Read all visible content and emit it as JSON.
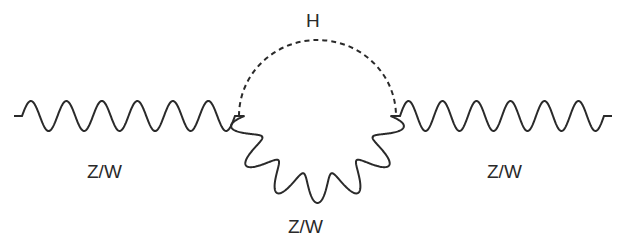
{
  "diagram": {
    "type": "feynman-diagram",
    "stroke_color": "#2a2a2a",
    "background": "#ffffff",
    "labels": {
      "higgs": "H",
      "left_boson": "Z/W",
      "loop_boson": "Z/W",
      "right_boson": "Z/W"
    },
    "vertices": [
      {
        "name": "left-vertex",
        "x": 239,
        "y": 116
      },
      {
        "name": "right-vertex",
        "x": 396,
        "y": 116
      }
    ],
    "propagators": [
      {
        "name": "left-external-boson",
        "style": "wavy",
        "from": [
          14,
          116
        ],
        "to": [
          239,
          116
        ],
        "label": "Z/W"
      },
      {
        "name": "higgs-loop-line",
        "style": "dashed",
        "from": "left-vertex",
        "to": "right-vertex",
        "label": "H"
      },
      {
        "name": "boson-loop-line",
        "style": "wavy-arc",
        "from": "left-vertex",
        "to": "right-vertex",
        "label": "Z/W"
      },
      {
        "name": "right-external-boson",
        "style": "wavy",
        "from": [
          396,
          116
        ],
        "to": [
          612,
          116
        ],
        "label": "Z/W"
      }
    ]
  }
}
